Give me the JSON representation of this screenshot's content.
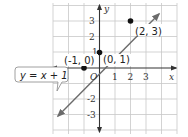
{
  "graph": {
    "equation_label": "y = x + 1",
    "axes": {
      "x_label": "x",
      "y_label": "y",
      "origin_label": "O"
    },
    "x_ticks": [
      "-2",
      "1",
      "2",
      "3"
    ],
    "y_ticks": [
      "3",
      "2",
      "1",
      "-2",
      "-3"
    ],
    "points": [
      {
        "label": "(-1, 0)",
        "x": -1,
        "y": 0
      },
      {
        "label": "(0, 1)",
        "x": 0,
        "y": 1
      },
      {
        "label": "(2, 3)",
        "x": 2,
        "y": 3
      }
    ],
    "colors": {
      "line": "#6b6b6b",
      "axis": "#333333",
      "grid": "#c8c8c8",
      "point": "#111111"
    }
  }
}
